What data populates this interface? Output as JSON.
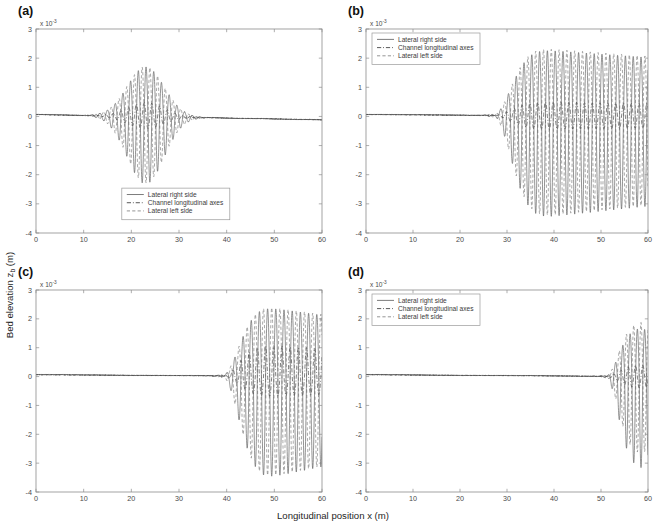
{
  "figure": {
    "x_axis_label": "Longitudinal position x (m)",
    "y_axis_label_main": "Bed elevation z",
    "y_axis_label_sub": "b",
    "y_axis_label_tail": " (m)",
    "exponent_prefix": "x 10",
    "exponent_power": "-3",
    "x_ticks": [
      "0",
      "10",
      "20",
      "30",
      "40",
      "50",
      "60"
    ],
    "y_ticks": [
      "3",
      "2",
      "1",
      "0",
      "-1",
      "-2",
      "-3",
      "-4"
    ],
    "colors": {
      "right_side": "#5a5a5a",
      "channel_axis": "#2e2e2e",
      "left_side": "#7a7a7a",
      "frame": "#8c8c8c",
      "text": "#1a1a1a"
    }
  },
  "legend": {
    "entries": [
      {
        "label": "Lateral right side",
        "style": "solid"
      },
      {
        "label": "Channel longitudinal axes",
        "style": "dashdot"
      },
      {
        "label": "Lateral left side",
        "style": "dashed"
      }
    ]
  },
  "chart_data": {
    "type": "line",
    "title": "",
    "xlabel": "Longitudinal position x (m)",
    "ylabel": "Bed elevation z_b (m)",
    "xlim": [
      0,
      60
    ],
    "ylim": [
      -0.004,
      0.003
    ],
    "y_scale_multiplier": 0.001,
    "grid": false,
    "legend_entries": [
      "Lateral right side",
      "Channel longitudinal axes",
      "Lateral left side"
    ],
    "panels": [
      {
        "label": "(a)",
        "legend_position": "bottom-center",
        "description": "Localized wave packet centred near x = 23 m; perturbation confined between roughly x = 12 m and x = 35 m, flat elsewhere.",
        "packet": {
          "center": 23.0,
          "envelope_width": 5.6,
          "wavelength": 1.62,
          "phase": 0.0
        },
        "series": [
          {
            "name": "Lateral right side",
            "style": "solid",
            "peak_positive": 0.0017,
            "peak_negative": -0.00232,
            "amplitude": 0.00205,
            "phase_offset": 0.0,
            "baseline_start": 7e-05,
            "baseline_end": -0.00012
          },
          {
            "name": "Channel longitudinal axes",
            "style": "dashdot",
            "peak_positive": 0.00048,
            "peak_negative": -0.00042,
            "amplitude": 0.00045,
            "phase_offset": 1.5708,
            "baseline_start": 6e-05,
            "baseline_end": -0.00011
          },
          {
            "name": "Lateral left side",
            "style": "dashed",
            "peak_positive": 0.00172,
            "peak_negative": -0.00228,
            "amplitude": 0.002,
            "phase_offset": 3.1416,
            "baseline_start": 7e-05,
            "baseline_end": -0.00012
          }
        ]
      },
      {
        "label": "(b)",
        "legend_position": "top-left",
        "description": "Disturbance initiates near x = 27 m and grows to saturated oscillations spanning x = 32 m to 60 m.",
        "packet": {
          "onset": 27.0,
          "growth_length": 6.5,
          "saturation": 36.0,
          "wavelength": 1.66,
          "phase": 0.0
        },
        "series": [
          {
            "name": "Lateral right side",
            "style": "solid",
            "peak_positive": 0.0023,
            "peak_negative": -0.0035,
            "amplitude": 0.0029,
            "phase_offset": 0.0,
            "baseline_start": 7e-05,
            "end_value": 0.0014
          },
          {
            "name": "Channel longitudinal axes",
            "style": "dashdot",
            "peak_positive": 0.0005,
            "peak_negative": -0.00045,
            "amplitude": 0.00047,
            "phase_offset": 1.5708,
            "baseline_start": 6e-05,
            "end_value": 0.0002
          },
          {
            "name": "Lateral left side",
            "style": "dashed",
            "peak_positive": 0.00235,
            "peak_negative": -0.00345,
            "amplitude": 0.0029,
            "phase_offset": 3.1416,
            "baseline_start": 7e-05,
            "end_value": 0.0009
          }
        ]
      },
      {
        "label": "(c)",
        "legend_position": "none",
        "description": "Flat bed until about x = 39 m, then rapidly amplifying oscillations reaching full amplitude by x = 48 m and continuing to x = 60 m.",
        "packet": {
          "onset": 39.0,
          "growth_length": 6.0,
          "saturation": 47.5,
          "wavelength": 1.72,
          "phase": 0.0
        },
        "series": [
          {
            "name": "Lateral right side",
            "style": "solid",
            "peak_positive": 0.00242,
            "peak_negative": -0.00355,
            "amplitude": 0.00298,
            "phase_offset": 0.0,
            "baseline_start": 7e-05,
            "end_value": 0.0023
          },
          {
            "name": "Channel longitudinal axes",
            "style": "dashdot",
            "peak_positive": 0.0011,
            "peak_negative": -0.0007,
            "amplitude": 0.0009,
            "phase_offset": 1.5708,
            "baseline_start": 6e-05,
            "end_value": 0.0009
          },
          {
            "name": "Lateral left side",
            "style": "dashed",
            "peak_positive": 0.00245,
            "peak_negative": -0.00352,
            "amplitude": 0.00298,
            "phase_offset": 3.1416,
            "baseline_start": 7e-05,
            "end_value": 0.0024
          }
        ]
      },
      {
        "label": "(d)",
        "legend_position": "top-left",
        "description": "Bed stays flat until roughly x = 51 m; oscillations emerge and grow steeply over the final few metres, reaching about -3.2e-3 at x = 60 m.",
        "packet": {
          "onset": 51.0,
          "growth_length": 4.5,
          "saturation": 59.0,
          "wavelength": 1.55,
          "phase": 0.0
        },
        "series": [
          {
            "name": "Lateral right side",
            "style": "solid",
            "peak_positive": 0.0017,
            "peak_negative": -0.0032,
            "amplitude": 0.0022,
            "phase_offset": 0.0,
            "baseline_start": 7e-05,
            "end_value": -0.0032
          },
          {
            "name": "Channel longitudinal axes",
            "style": "dashdot",
            "peak_positive": 0.0004,
            "peak_negative": -0.0004,
            "amplitude": 0.0004,
            "phase_offset": 1.5708,
            "baseline_start": 6e-05,
            "end_value": 0.0001
          },
          {
            "name": "Lateral left side",
            "style": "dashed",
            "peak_positive": 0.0019,
            "peak_negative": -0.0027,
            "amplitude": 0.0021,
            "phase_offset": 3.1416,
            "baseline_start": 7e-05,
            "end_value": 0.0019
          }
        ]
      }
    ]
  }
}
